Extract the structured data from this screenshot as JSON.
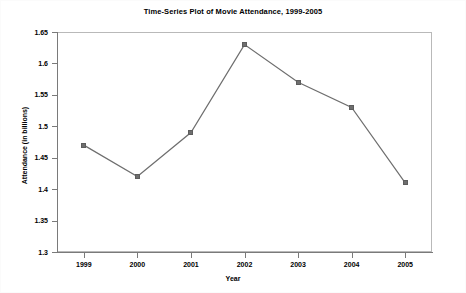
{
  "chart_data": {
    "type": "line",
    "title": "Time-Series Plot of Movie Attendance, 1999-2005",
    "xlabel": "Year",
    "ylabel": "Attendance (in billions)",
    "categories": [
      "1999",
      "2000",
      "2001",
      "2002",
      "2003",
      "2004",
      "2005"
    ],
    "values": [
      1.47,
      1.42,
      1.49,
      1.63,
      1.57,
      1.53,
      1.41
    ],
    "series": [
      {
        "name": "Movie Attendance",
        "values": [
          1.47,
          1.42,
          1.49,
          1.63,
          1.57,
          1.53,
          1.41
        ]
      }
    ],
    "ylim": [
      1.3,
      1.65
    ],
    "ytick_step": 0.05,
    "yticks": [
      "1.65",
      "1.6",
      "1.55",
      "1.5",
      "1.45",
      "1.4",
      "1.35",
      "1.3"
    ],
    "ytick_values": [
      1.65,
      1.6,
      1.55,
      1.5,
      1.45,
      1.4,
      1.35,
      1.3
    ],
    "grid": false,
    "legend": null,
    "marker": "square",
    "line_color": "#6e6e6e",
    "marker_color": "#6e6e6e",
    "frame_color": "#b9b9b9",
    "background_color": "#ffffff",
    "text_color": "#000000"
  }
}
